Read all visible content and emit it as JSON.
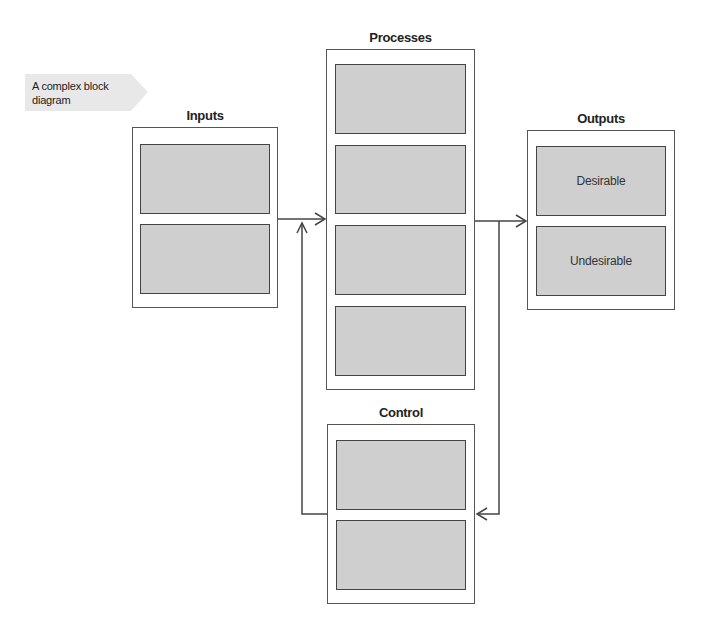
{
  "callout": {
    "text": "A complex block diagram"
  },
  "groups": {
    "inputs": {
      "title": "Inputs",
      "blocks": [
        "",
        ""
      ]
    },
    "processes": {
      "title": "Processes",
      "blocks": [
        "",
        "",
        "",
        ""
      ]
    },
    "outputs": {
      "title": "Outputs",
      "blocks": [
        "Desirable",
        "Undesirable"
      ]
    },
    "control": {
      "title": "Control",
      "blocks": [
        "",
        ""
      ]
    }
  },
  "colors": {
    "block_fill": "#cfcfcf",
    "border": "#444444",
    "callout_fill": "#e8e8e8"
  }
}
